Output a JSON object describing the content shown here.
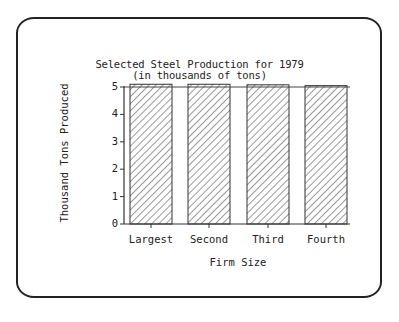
{
  "chart_data": {
    "type": "bar",
    "title": "Selected Steel Production for 1979",
    "subtitle": "(in thousands of tons)",
    "xlabel": "Firm Size",
    "ylabel": "Thousand Tons Produced",
    "categories": [
      "Largest",
      "Second",
      "Third",
      "Fourth"
    ],
    "values": [
      5.1,
      5.1,
      5.08,
      5.05
    ],
    "ylim": [
      0,
      5
    ],
    "yticks": [
      "0",
      "1",
      "2",
      "3",
      "4",
      "5"
    ],
    "reference_line": 5,
    "fill": "diagonal-hatch",
    "grid": false,
    "legend": null
  }
}
